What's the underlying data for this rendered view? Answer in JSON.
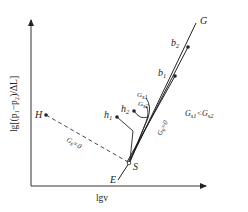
{
  "diagram": {
    "axes": {
      "x_label": "lgv",
      "y_label": "lg[(p₁−p₂)/ΔL]"
    },
    "points": {
      "G": "G",
      "b2": {
        "main": "b",
        "sub": "2"
      },
      "b1": {
        "main": "b",
        "sub": "1"
      },
      "H": "H",
      "h1": {
        "main": "h",
        "sub": "1"
      },
      "h2": {
        "main": "h",
        "sub": "2"
      },
      "S": "S",
      "E": "E"
    },
    "curve_labels": {
      "gs1": {
        "main": "G",
        "sub": "s1"
      },
      "gs2": {
        "main": "G",
        "sub": "s2"
      },
      "gs0_dashed": {
        "main": "G",
        "sub": "s",
        "rest": "=0"
      },
      "gs0_line": {
        "main": "G",
        "sub": "s",
        "rest": "=0"
      }
    },
    "annotation": {
      "left": "G",
      "left_sub": "s1",
      "op": "<",
      "right": "G",
      "right_sub": "s2"
    },
    "colors": {
      "line": "#222222",
      "background": "#ffffff"
    }
  }
}
